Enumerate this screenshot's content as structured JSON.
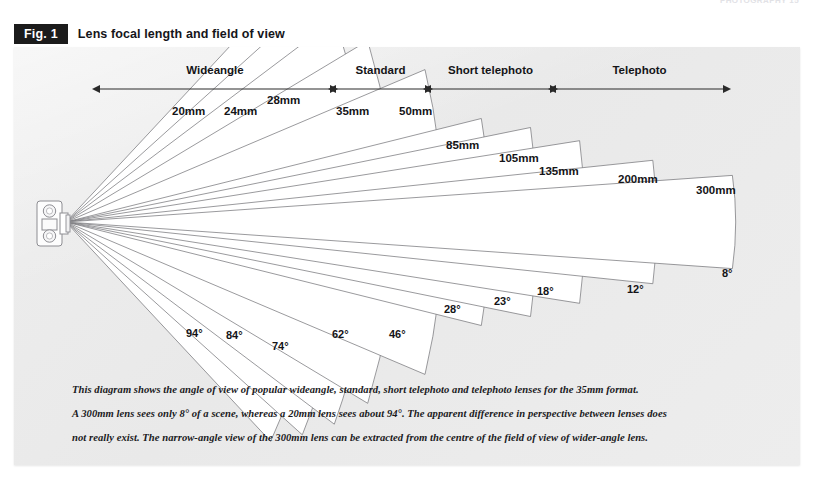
{
  "page": {
    "running_head": "PHOTOGRAPHY 15"
  },
  "figure": {
    "tag": "Fig. 1",
    "title": "Lens focal length and field of view"
  },
  "scale_bands": [
    {
      "name": "wideangle",
      "label": "Wideangle",
      "x_start": 86,
      "x_end": 316
    },
    {
      "name": "standard",
      "label": "Standard",
      "x_start": 322,
      "x_end": 411
    },
    {
      "name": "short-telephoto",
      "label": "Short telephoto",
      "x_start": 417,
      "x_end": 536
    },
    {
      "name": "telephoto",
      "label": "Telephoto",
      "x_start": 542,
      "x_end": 709
    }
  ],
  "scale": {
    "axis_y": 42,
    "label_y": 27
  },
  "chart_data": {
    "type": "diagram",
    "title": "Lens focal length and field of view",
    "xlabel": "",
    "ylabel": "",
    "vertex": {
      "x": 52,
      "y": 175
    },
    "lenses": [
      {
        "focal_length": "20mm",
        "angle": "94°",
        "angle_deg": 94,
        "length": 300,
        "top_label_x": 158,
        "top_label_y": 68,
        "bottom_label_x": 172,
        "bottom_label_y": 290
      },
      {
        "focal_length": "24mm",
        "angle": "84°",
        "angle_deg": 84,
        "length": 318,
        "top_label_x": 210,
        "top_label_y": 68,
        "bottom_label_x": 212,
        "bottom_label_y": 292
      },
      {
        "focal_length": "28mm",
        "angle": "74°",
        "angle_deg": 74,
        "length": 336,
        "top_label_x": 253,
        "top_label_y": 57,
        "bottom_label_x": 258,
        "bottom_label_y": 303
      },
      {
        "focal_length": "35mm",
        "angle": "62°",
        "angle_deg": 62,
        "length": 352,
        "top_label_x": 322,
        "top_label_y": 68,
        "bottom_label_x": 318,
        "bottom_label_y": 291
      },
      {
        "focal_length": "50mm",
        "angle": "46°",
        "angle_deg": 46,
        "length": 390,
        "top_label_x": 385,
        "top_label_y": 68,
        "bottom_label_x": 375,
        "bottom_label_y": 291
      },
      {
        "focal_length": "85mm",
        "angle": "28°",
        "angle_deg": 28,
        "length": 428,
        "top_label_x": 432,
        "top_label_y": 102,
        "bottom_label_x": 430,
        "bottom_label_y": 266
      },
      {
        "focal_length": "105mm",
        "angle": "23°",
        "angle_deg": 23,
        "length": 474,
        "top_label_x": 485,
        "top_label_y": 115,
        "bottom_label_x": 480,
        "bottom_label_y": 258
      },
      {
        "focal_length": "135mm",
        "angle": "18°",
        "angle_deg": 18,
        "length": 520,
        "top_label_x": 525,
        "top_label_y": 128,
        "bottom_label_x": 523,
        "bottom_label_y": 248
      },
      {
        "focal_length": "200mm",
        "angle": "12°",
        "angle_deg": 12,
        "length": 590,
        "top_label_x": 604,
        "top_label_y": 136,
        "bottom_label_x": 613,
        "bottom_label_y": 246
      },
      {
        "focal_length": "300mm",
        "angle": "8°",
        "angle_deg": 8,
        "length": 668,
        "top_label_x": 682,
        "top_label_y": 147,
        "bottom_label_x": 708,
        "bottom_label_y": 230
      }
    ],
    "bands": [
      "Wideangle",
      "Standard",
      "Short telephoto",
      "Telephoto"
    ]
  },
  "camera": {
    "name": "twin-lens-camera-icon"
  },
  "caption": {
    "line1": "This diagram shows the angle of view of popular wideangle, standard, short telephoto and telephoto lenses for the 35mm format.",
    "line2": "A 300mm lens sees only 8° of a scene, whereas a 20mm lens sees about 94°. The apparent difference in perspective between lenses does",
    "line3": "not really exist. The narrow-angle view of the 300mm lens can be extracted from the centre of the field of view of wider-angle lens."
  },
  "colors": {
    "panel_bg": "#ececec",
    "wedge_fill": "#ffffff",
    "wedge_stroke": "#6e6e72",
    "ink": "#141417",
    "tag_bg": "#1b1b1b"
  }
}
